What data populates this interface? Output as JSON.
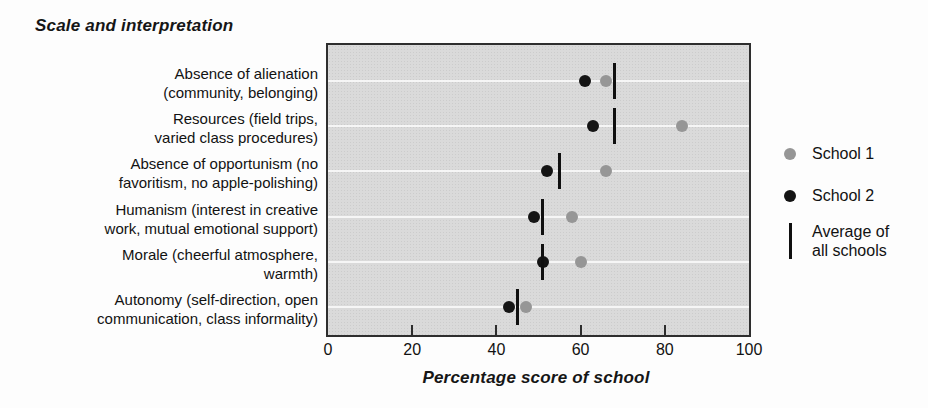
{
  "title": "Scale and interpretation",
  "chart_data": {
    "type": "scatter",
    "subtype": "dot-plot-horizontal-categories",
    "title": "Scale and interpretation",
    "xlabel": "Percentage score of school",
    "xlim": [
      0,
      100
    ],
    "xticks": [
      0,
      20,
      40,
      60,
      80,
      100
    ],
    "grid": "horizontal white gridline at each category row",
    "legend_position": "right",
    "plot_background": "#dadada",
    "categories": [
      {
        "label_lines": [
          "Absence of alienation",
          "(community, belonging)"
        ]
      },
      {
        "label_lines": [
          "Resources (field trips,",
          "varied class procedures)"
        ]
      },
      {
        "label_lines": [
          "Absence of opportunism (no",
          "favoritism, no apple-polishing)"
        ]
      },
      {
        "label_lines": [
          "Humanism (interest in creative",
          "work, mutual emotional support)"
        ]
      },
      {
        "label_lines": [
          "Morale (cheerful atmosphere,",
          "warmth)"
        ]
      },
      {
        "label_lines": [
          "Autonomy (self-direction, open",
          "communication, class informality)"
        ]
      }
    ],
    "series": [
      {
        "name": "School 1",
        "marker": "circle",
        "color": "#969696",
        "values": [
          66,
          84,
          66,
          58,
          60,
          47
        ]
      },
      {
        "name": "School 2",
        "marker": "circle",
        "color": "#141414",
        "values": [
          61,
          63,
          52,
          49,
          51,
          43
        ]
      },
      {
        "name": "Average of all schools",
        "marker": "vertical-line",
        "color": "#101010",
        "values": [
          68,
          68,
          55,
          51,
          51,
          45
        ]
      }
    ]
  },
  "legend": {
    "items": [
      {
        "label": "School 1",
        "marker": "circle",
        "color": "#969696"
      },
      {
        "label": "School 2",
        "marker": "circle",
        "color": "#141414"
      },
      {
        "label": "Average of all schools",
        "marker": "vertical-line",
        "color": "#101010"
      }
    ]
  }
}
